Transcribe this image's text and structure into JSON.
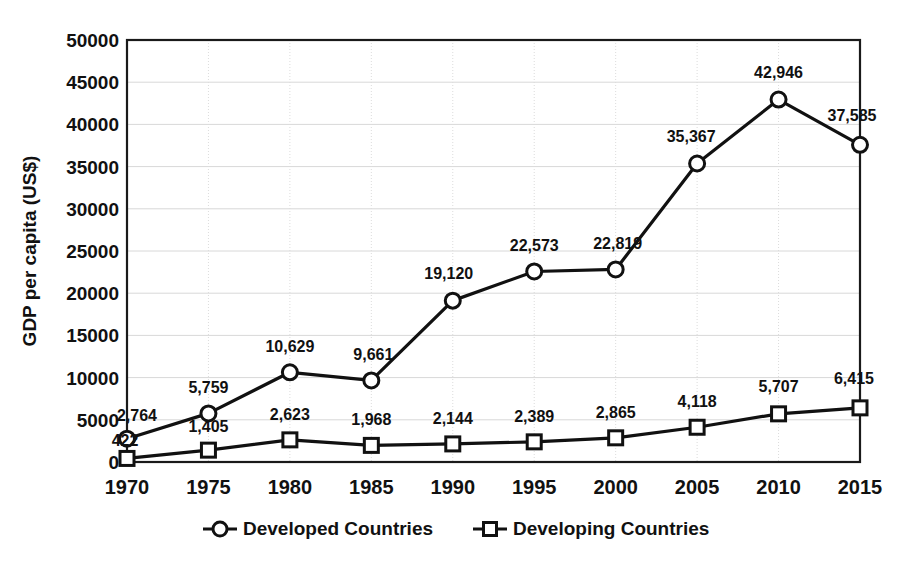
{
  "chart_data": {
    "type": "line",
    "title": "",
    "xlabel": "",
    "ylabel": "GDP per capita (US$)",
    "categories": [
      "1970",
      "1975",
      "1980",
      "1985",
      "1990",
      "1995",
      "2000",
      "2005",
      "2010",
      "2015"
    ],
    "x": [
      1970,
      1975,
      1980,
      1985,
      1990,
      1995,
      2000,
      2005,
      2010,
      2015
    ],
    "ylim": [
      0,
      50000
    ],
    "xlim": [
      1970,
      2015
    ],
    "yticks": [
      0,
      5000,
      10000,
      15000,
      20000,
      25000,
      30000,
      35000,
      40000,
      45000,
      50000
    ],
    "ytick_labels": [
      "0",
      "5000",
      "10000",
      "15000",
      "20000",
      "25000",
      "30000",
      "35000",
      "40000",
      "45000",
      "50000"
    ],
    "grid": "both-light",
    "legend_position": "bottom",
    "series": [
      {
        "name": "Developed Countries",
        "marker": "circle",
        "color": "#111111",
        "values": [
          2764,
          5759,
          10629,
          9661,
          19120,
          22573,
          22819,
          35367,
          42946,
          37585
        ],
        "data_labels": [
          "2,764",
          "5,759",
          "10,629",
          "9,661",
          "19,120",
          "22,573",
          "22,819",
          "35,367",
          "42,946",
          "37,585"
        ]
      },
      {
        "name": "Developing Countries",
        "marker": "square",
        "color": "#111111",
        "values": [
          422,
          1405,
          2623,
          1968,
          2144,
          2389,
          2865,
          4118,
          5707,
          6415
        ],
        "data_labels": [
          "422",
          "1,405",
          "2,623",
          "1,968",
          "2,144",
          "2,389",
          "2,865",
          "4,118",
          "5,707",
          "6,415"
        ]
      }
    ]
  },
  "legend": {
    "items": [
      {
        "label": "Developed Countries",
        "marker": "circle-marker-icon"
      },
      {
        "label": "Developing Countries",
        "marker": "square-marker-icon"
      }
    ]
  }
}
